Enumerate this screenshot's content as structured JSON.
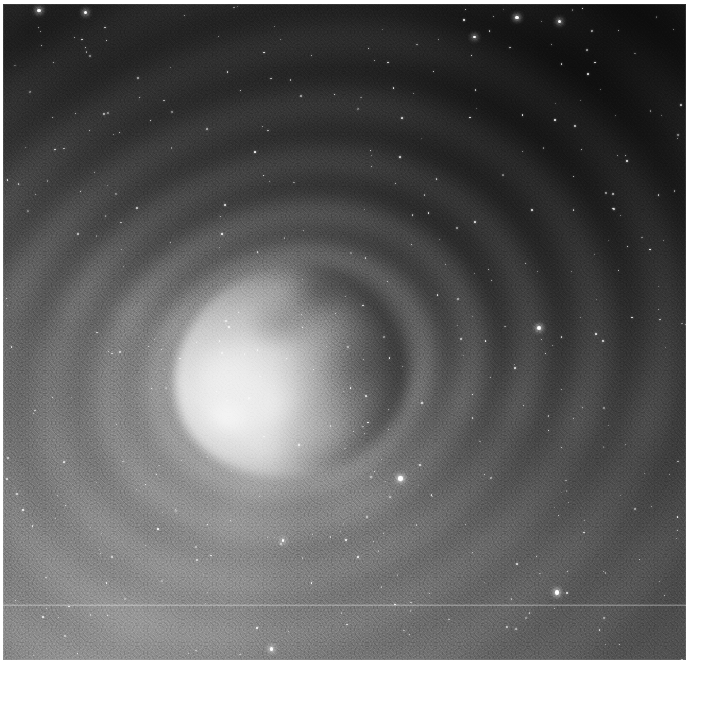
{
  "plate": {
    "title": "Comet coma with concentric dust shells",
    "medium": "grayscale astronomical image",
    "orientation": "landscape-square",
    "background_color": "#1a1a1a",
    "highlight_color": "#fafafa",
    "page_color": "#ffffff",
    "frame": {
      "left": 3,
      "top": 4,
      "width": 683,
      "height": 656
    }
  },
  "scene": {
    "nucleus": {
      "name": "bright-coma-nucleus",
      "center_x": 287,
      "center_y": 367,
      "width": 236,
      "height": 212,
      "rotation_deg": -12,
      "brightness": "saturated-white",
      "description": "Irregular bright blob with mottled bright knots on the sunward (left) side and a darker shaded limb on the right."
    },
    "shells": [
      {
        "name": "shell-1",
        "radius": 130,
        "thickness": 16,
        "opacity": 0.3,
        "rotation_deg": -22
      },
      {
        "name": "shell-2",
        "radius": 178,
        "thickness": 20,
        "opacity": 0.3,
        "rotation_deg": -22
      },
      {
        "name": "shell-3",
        "radius": 236,
        "thickness": 24,
        "opacity": 0.28,
        "rotation_deg": -24
      },
      {
        "name": "shell-4",
        "radius": 300,
        "thickness": 28,
        "opacity": 0.27,
        "rotation_deg": -24
      },
      {
        "name": "shell-5",
        "radius": 372,
        "thickness": 32,
        "opacity": 0.25,
        "rotation_deg": -26
      },
      {
        "name": "shell-6",
        "radius": 452,
        "thickness": 36,
        "opacity": 0.23,
        "rotation_deg": -26
      },
      {
        "name": "shell-7",
        "radius": 540,
        "thickness": 40,
        "opacity": 0.21,
        "rotation_deg": -28
      },
      {
        "name": "shell-8",
        "radius": 636,
        "thickness": 44,
        "opacity": 0.19,
        "rotation_deg": -28
      },
      {
        "name": "shell-9",
        "radius": 742,
        "thickness": 48,
        "opacity": 0.16,
        "rotation_deg": -30
      }
    ],
    "jets": [
      {
        "name": "jet-se-1",
        "angle_deg": 104,
        "length": 330,
        "opacity": 0.4
      },
      {
        "name": "jet-s-1",
        "angle_deg": 120,
        "length": 300,
        "opacity": 0.34
      },
      {
        "name": "jet-sw-1",
        "angle_deg": 142,
        "length": 320,
        "opacity": 0.38
      },
      {
        "name": "jet-sw-2",
        "angle_deg": 163,
        "length": 300,
        "opacity": 0.34
      },
      {
        "name": "jet-w-1",
        "angle_deg": 182,
        "length": 280,
        "opacity": 0.3
      },
      {
        "name": "jet-nw-1",
        "angle_deg": 203,
        "length": 250,
        "opacity": 0.24
      },
      {
        "name": "jet-ne-1",
        "angle_deg": 62,
        "length": 260,
        "opacity": 0.2
      }
    ],
    "stars_visible": 420,
    "scanline": {
      "name": "detector-scanline",
      "y": 601,
      "opacity": 0.3
    }
  },
  "chart_data": {
    "type": "heatmap",
    "xlabel": "",
    "ylabel": "",
    "colormap": "grayscale",
    "value_range": [
      0,
      255
    ],
    "legend_position": "none",
    "grid": false,
    "annotations": []
  }
}
